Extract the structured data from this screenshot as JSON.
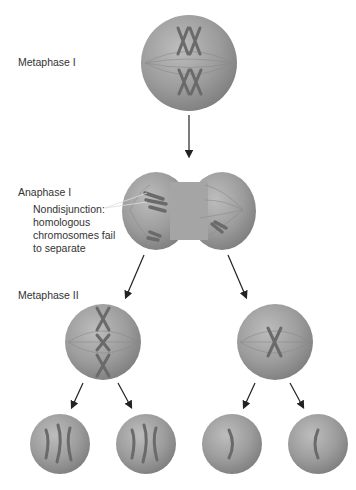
{
  "figure": {
    "labels": {
      "metaphase1": "Metaphase I",
      "anaphase1": "Anaphase I",
      "nondisjunction": [
        "Nondisjunction:",
        "homologous",
        "chromosomes fail",
        "to separate"
      ],
      "metaphase2": "Metaphase II"
    },
    "colors": {
      "cell": "#9a9a9a",
      "chromosome": "#6e6e6e",
      "arrow": "#222222",
      "text": "#333333"
    }
  }
}
